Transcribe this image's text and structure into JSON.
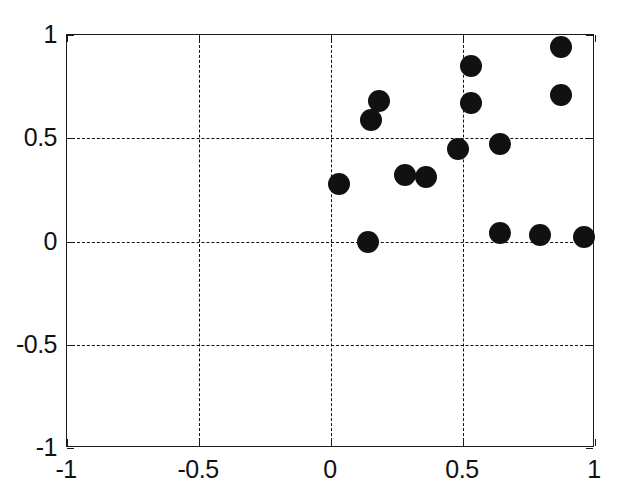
{
  "chart_data": {
    "type": "scatter",
    "title": "",
    "xlabel": "",
    "ylabel": "",
    "xlim": [
      -1,
      1
    ],
    "ylim": [
      -1,
      1
    ],
    "grid": true,
    "grid_style": "dashed",
    "legend": null,
    "marker": {
      "shape": "circle",
      "color": "#111111",
      "size_px": 22,
      "filled": true
    },
    "xticks": [
      -1,
      -0.5,
      0,
      0.5,
      1
    ],
    "xticklabels": [
      "-1",
      "-0.5",
      "0",
      "0.5",
      "1"
    ],
    "yticks": [
      -1,
      -0.5,
      0,
      0.5,
      1
    ],
    "yticklabels": [
      "-1",
      "-0.5",
      "0",
      "0.5",
      "1"
    ],
    "points": [
      {
        "x": 0.03,
        "y": 0.28
      },
      {
        "x": 0.14,
        "y": 0.0
      },
      {
        "x": 0.15,
        "y": 0.59
      },
      {
        "x": 0.18,
        "y": 0.68
      },
      {
        "x": 0.28,
        "y": 0.32
      },
      {
        "x": 0.36,
        "y": 0.31
      },
      {
        "x": 0.48,
        "y": 0.45
      },
      {
        "x": 0.53,
        "y": 0.85
      },
      {
        "x": 0.53,
        "y": 0.67
      },
      {
        "x": 0.64,
        "y": 0.47
      },
      {
        "x": 0.64,
        "y": 0.04
      },
      {
        "x": 0.79,
        "y": 0.03
      },
      {
        "x": 0.87,
        "y": 0.94
      },
      {
        "x": 0.87,
        "y": 0.71
      },
      {
        "x": 0.96,
        "y": 0.02
      }
    ]
  },
  "axes": {
    "frame_color": "#1a1a1a",
    "background": "#ffffff"
  }
}
